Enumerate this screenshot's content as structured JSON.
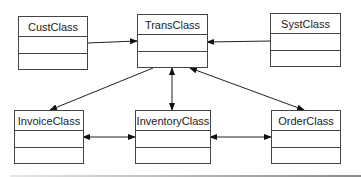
{
  "diagram": {
    "type": "class-diagram",
    "classes": [
      {
        "id": "cust",
        "name": "CustClass"
      },
      {
        "id": "trans",
        "name": "TransClass"
      },
      {
        "id": "syst",
        "name": "SystClass"
      },
      {
        "id": "invoice",
        "name": "InvoiceClass"
      },
      {
        "id": "inventory",
        "name": "InventoryClass"
      },
      {
        "id": "order",
        "name": "OrderClass"
      }
    ],
    "relationships": [
      {
        "from": "CustClass",
        "to": "TransClass",
        "direction": "to"
      },
      {
        "from": "SystClass",
        "to": "TransClass",
        "direction": "to"
      },
      {
        "from": "TransClass",
        "to": "InvoiceClass",
        "direction": "to"
      },
      {
        "from": "TransClass",
        "to": "InventoryClass",
        "direction": "both"
      },
      {
        "from": "TransClass",
        "to": "OrderClass",
        "direction": "both"
      },
      {
        "from": "InvoiceClass",
        "to": "InventoryClass",
        "direction": "both"
      },
      {
        "from": "InventoryClass",
        "to": "OrderClass",
        "direction": "both"
      }
    ],
    "colors": {
      "line": "#222222",
      "border": "#444444",
      "background": "#ffffff"
    }
  }
}
